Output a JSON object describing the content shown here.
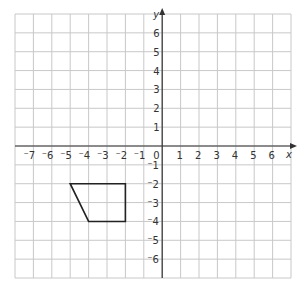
{
  "axes": {
    "x_label": "x",
    "y_label": "y",
    "x_range": [
      -8,
      7
    ],
    "y_range": [
      -7,
      7
    ],
    "origin_label": "0"
  },
  "x_ticks": [
    "-7",
    "-6",
    "-5",
    "-4",
    "-3",
    "-2",
    "-1",
    "1",
    "2",
    "3",
    "4",
    "5",
    "6"
  ],
  "y_ticks": [
    "6",
    "5",
    "4",
    "3",
    "2",
    "1",
    "-1",
    "-2",
    "-3",
    "-4",
    "-5",
    "-6"
  ],
  "shape": {
    "name": "trapezium",
    "vertices": [
      [
        -5,
        -2
      ],
      [
        -2,
        -2
      ],
      [
        -2,
        -4
      ],
      [
        -4,
        -4
      ]
    ]
  },
  "colors": {
    "grid": "#c8c8c8",
    "axis": "#333333",
    "shape": "#222222"
  }
}
